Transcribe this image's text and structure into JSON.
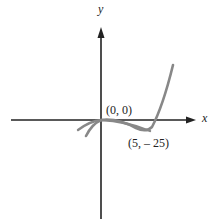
{
  "figure": {
    "axes": {
      "x_label": "x",
      "y_label": "y",
      "color": "#222222"
    },
    "curve": {
      "color": "#888888",
      "description": "cubic-like curve through origin with local minimum at (5, -25), rising steeply to the right"
    },
    "points": [
      {
        "label": "(0, 0)",
        "x": 0,
        "y": 0
      },
      {
        "label": "(5, – 25)",
        "x": 5,
        "y": -25
      }
    ]
  }
}
